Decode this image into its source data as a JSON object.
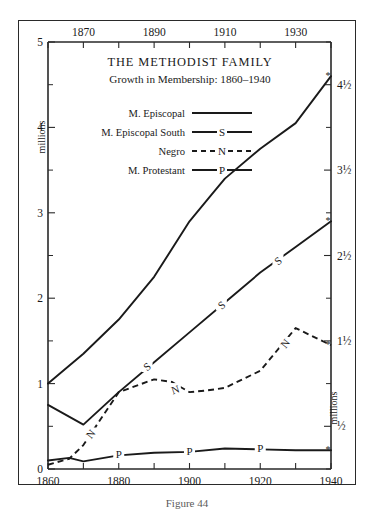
{
  "figure": {
    "caption": "Figure 44",
    "title": "THE METHODIST FAMILY",
    "subtitle": "Growth in Membership: 1860–1940"
  },
  "axes": {
    "left_title": "millions",
    "right_title": "millions",
    "top_tick_labels": [
      "1870",
      "1890",
      "1910",
      "1930"
    ],
    "bottom_tick_labels": [
      "1860",
      "1880",
      "1900",
      "1920",
      "1940"
    ],
    "left_tick_labels": [
      "0",
      "1",
      "2",
      "3",
      "4",
      "5"
    ],
    "right_tick_labels": [
      "½",
      "1½",
      "2½",
      "3½",
      "4½"
    ]
  },
  "legend": {
    "entries": [
      {
        "label": "M. Episcopal",
        "marker": "",
        "style": "solid"
      },
      {
        "label": "M. Episcopal South",
        "marker": "S",
        "style": "solid"
      },
      {
        "label": "Negro",
        "marker": "N",
        "style": "dashed"
      },
      {
        "label": "M. Protestant",
        "marker": "P",
        "style": "solid"
      }
    ]
  },
  "chart_data": {
    "type": "line",
    "title": "THE METHODIST FAMILY",
    "subtitle": "Growth in Membership: 1860–1940",
    "xlabel": "",
    "ylabel": "millions",
    "xlim": [
      1860,
      1940
    ],
    "ylim": [
      0,
      5
    ],
    "grid": false,
    "legend_position": "inside-top-center",
    "xticks": [
      1860,
      1870,
      1880,
      1890,
      1900,
      1910,
      1920,
      1930,
      1940
    ],
    "yticks": [
      0,
      0.5,
      1,
      1.5,
      2,
      2.5,
      3,
      3.5,
      4,
      4.5,
      5
    ],
    "series": [
      {
        "name": "M. Episcopal",
        "style": "solid",
        "marker": "",
        "x": [
          1860,
          1870,
          1880,
          1890,
          1900,
          1906,
          1910,
          1920,
          1930,
          1940
        ],
        "values": [
          1.0,
          1.35,
          1.75,
          2.25,
          2.9,
          3.2,
          3.4,
          3.75,
          4.05,
          4.6
        ]
      },
      {
        "name": "M. Episcopal South",
        "style": "solid",
        "marker": "S",
        "x": [
          1860,
          1870,
          1880,
          1890,
          1900,
          1910,
          1920,
          1930,
          1940
        ],
        "values": [
          0.75,
          0.52,
          0.9,
          1.25,
          1.6,
          1.95,
          2.3,
          2.6,
          2.9
        ]
      },
      {
        "name": "Negro",
        "style": "dashed",
        "marker": "N",
        "x": [
          1860,
          1866,
          1870,
          1880,
          1890,
          1895,
          1900,
          1905,
          1910,
          1920,
          1930,
          1940
        ],
        "values": [
          0.05,
          0.12,
          0.28,
          0.9,
          1.05,
          1.02,
          0.9,
          0.92,
          0.95,
          1.15,
          1.65,
          1.45
        ]
      },
      {
        "name": "M. Protestant",
        "style": "solid",
        "marker": "P",
        "x": [
          1860,
          1866,
          1870,
          1880,
          1890,
          1900,
          1910,
          1920,
          1930,
          1940
        ],
        "values": [
          0.1,
          0.13,
          0.09,
          0.16,
          0.19,
          0.2,
          0.24,
          0.23,
          0.22,
          0.22
        ]
      }
    ],
    "series_end_marker": "*"
  }
}
